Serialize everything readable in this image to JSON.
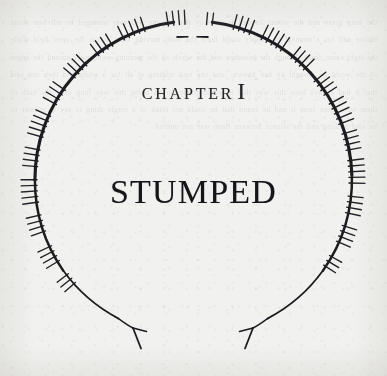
{
  "page": {
    "kind": "book-chapter-opening",
    "paper_color": "#f1f1ef",
    "ink_color": "#1c1c20",
    "width": 387,
    "height": 376
  },
  "heading": {
    "chapter_label": "Chapter",
    "chapter_numeral": "I",
    "title": "Stumped"
  },
  "ornament": {
    "name": "ogham-inscribed-open-ring",
    "center_x": 193,
    "center_y": 180,
    "radius": 159,
    "stroke_color": "#1c1c20",
    "stroke_width_top": 3.1,
    "stroke_width_bottom": 1.5,
    "top_gap_dashes": 2,
    "bottom_terminals": 2,
    "terminal_style": "three-pronged-fork",
    "tick_groups": [
      {
        "angle": -96,
        "count": 4,
        "side": "outer",
        "len": 11
      },
      {
        "angle": -84,
        "count": 2,
        "side": "outer",
        "len": 9
      },
      {
        "angle": -112,
        "count": 5,
        "side": "outer",
        "len": 12
      },
      {
        "angle": -124,
        "count": 4,
        "side": "outer",
        "len": 11
      },
      {
        "angle": -136,
        "count": 4,
        "side": "outer",
        "len": 12
      },
      {
        "angle": -148,
        "count": 4,
        "side": "outer",
        "len": 12
      },
      {
        "angle": -160,
        "count": 5,
        "side": "outer",
        "len": 13
      },
      {
        "angle": -172,
        "count": 4,
        "side": "outer",
        "len": 12
      },
      {
        "angle": 176,
        "count": 5,
        "side": "outer",
        "len": 13
      },
      {
        "angle": 164,
        "count": 4,
        "side": "outer",
        "len": 12
      },
      {
        "angle": 152,
        "count": 4,
        "side": "outer",
        "len": 12
      },
      {
        "angle": 141,
        "count": 3,
        "side": "outer",
        "len": 11
      },
      {
        "angle": -72,
        "count": 4,
        "side": "outer",
        "len": 12
      },
      {
        "angle": -60,
        "count": 5,
        "side": "outer",
        "len": 13
      },
      {
        "angle": -48,
        "count": 4,
        "side": "outer",
        "len": 12
      },
      {
        "angle": -36,
        "count": 4,
        "side": "outer",
        "len": 12
      },
      {
        "angle": -25,
        "count": 5,
        "side": "outer",
        "len": 13
      },
      {
        "angle": -14,
        "count": 4,
        "side": "outer",
        "len": 12
      },
      {
        "angle": -3,
        "count": 5,
        "side": "outer",
        "len": 13
      },
      {
        "angle": 9,
        "count": 4,
        "side": "outer",
        "len": 12
      },
      {
        "angle": 20,
        "count": 4,
        "side": "outer",
        "len": 12
      },
      {
        "angle": 31,
        "count": 3,
        "side": "outer",
        "len": 11
      }
    ]
  },
  "bleed_through": {
    "note": "faint mirrored text showing through from the reverse of the leaf",
    "lines": "the long grass and the stones beyond it the way that no one had ever managed to tell him about before and for a moment he simply stood there the wind moving slow across the open field while the light came down through the branches and the whole of the morning went quiet around the edges of the world he thought he had known  and she said nothing at all for a while and then she said that it had always been this way that it would likely go on being this way long after the both of them were gone from it and he found that he could not think of a single thing to say in answer so he said nothing and the silence between them was not unkind"
  }
}
